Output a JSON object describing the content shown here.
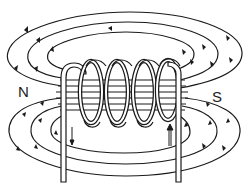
{
  "diagram": {
    "poles": {
      "north": "N",
      "south": "S"
    },
    "coil": {
      "turns": 4
    },
    "current_arrows": {
      "left_wire": "down",
      "right_wire": "up"
    },
    "field_loops": {
      "top": 3,
      "bottom": 3
    },
    "colors": {
      "line": "#1a1a1a",
      "background": "#ffffff"
    }
  }
}
